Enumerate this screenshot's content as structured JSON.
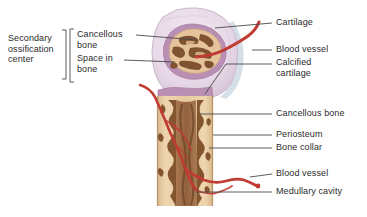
{
  "labels": {
    "left": [
      {
        "id": "secondary-ossification-center",
        "text": "Secondary\nossification\ncenter",
        "x": 8,
        "y": 38
      },
      {
        "id": "cancellous-bone-top",
        "text": "Cancellous\nbone",
        "x": 78,
        "y": 30
      },
      {
        "id": "space-in-bone",
        "text": "Space in\nbone",
        "x": 78,
        "y": 55
      }
    ],
    "right": [
      {
        "id": "cartilage",
        "text": "Cartilage",
        "x": 276,
        "y": 19
      },
      {
        "id": "blood-vessel-top",
        "text": "Blood vessel",
        "x": 276,
        "y": 46
      },
      {
        "id": "calcified-cartilage",
        "text": "Calcified\ncartilage",
        "x": 276,
        "y": 59
      },
      {
        "id": "cancellous-bone-shaft",
        "text": "Cancellous bone",
        "x": 276,
        "y": 110
      },
      {
        "id": "periosteum",
        "text": "Periosteum",
        "x": 276,
        "y": 131
      },
      {
        "id": "bone-collar",
        "text": "Bone collar",
        "x": 276,
        "y": 144
      },
      {
        "id": "blood-vessel-bottom",
        "text": "Blood vessel",
        "x": 276,
        "y": 170
      },
      {
        "id": "medullary-cavity",
        "text": "Medullary cavity",
        "x": 276,
        "y": 188
      }
    ]
  },
  "colors": {
    "cartilage": "#e9dce8",
    "cartilage_edge": "#cfc0d2",
    "calcified_cartilage": "#b98fb4",
    "cancellous_bone": "#e5c49b",
    "trabeculae": "#8a5b39",
    "marrow": "#9c6843",
    "bone_collar": "#e9cda6",
    "blood_vessel": "#c03b32",
    "leader_line": "#4a4a4a",
    "text": "#2b2b2b",
    "background": "#ffffff"
  }
}
